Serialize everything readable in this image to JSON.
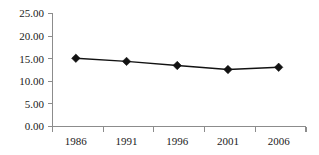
{
  "chart_data": {
    "type": "line",
    "title": "",
    "subtitle": "",
    "xlabel": "",
    "ylabel": "",
    "categories": [
      "1986",
      "1991",
      "1996",
      "2001",
      "2006"
    ],
    "x": [
      1986,
      1991,
      1996,
      2001,
      2006
    ],
    "values": [
      15.1,
      14.4,
      13.5,
      12.6,
      13.1
    ],
    "series": [
      {
        "name": "",
        "values": [
          15.1,
          14.4,
          13.5,
          12.6,
          13.1
        ]
      }
    ],
    "ylim": [
      0,
      25
    ],
    "ytick_step": 5,
    "ytick_labels": [
      "0.00",
      "5.00",
      "10.00",
      "15.00",
      "20.00",
      "25.00"
    ],
    "ytick_values": [
      0,
      5,
      10,
      15,
      20,
      25
    ],
    "xtick_labels": [
      "1986",
      "1991",
      "1996",
      "2001",
      "2006"
    ],
    "grid": false,
    "legend": false,
    "legend_position": "none",
    "marker": "diamond",
    "annotations": [],
    "colors": {
      "line": "#121212",
      "marker": "#121212",
      "axis": "#8c8c8c",
      "text": "#1a1a1a",
      "background": "#ffffff"
    }
  }
}
